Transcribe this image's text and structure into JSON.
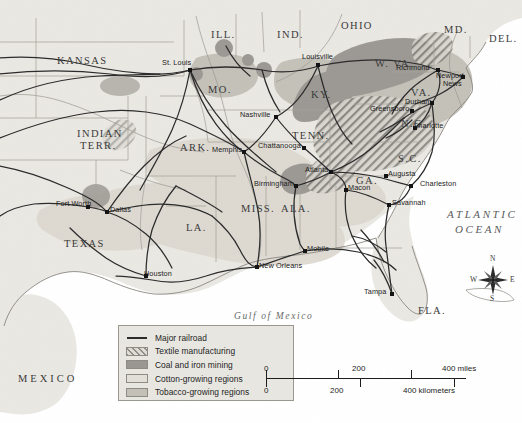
{
  "map": {
    "title_region": "The New South",
    "states": [
      {
        "label": "KANSAS",
        "x": 57,
        "y": 55,
        "size": "big"
      },
      {
        "label": "ILL.",
        "x": 211,
        "y": 29,
        "size": "big"
      },
      {
        "label": "IND.",
        "x": 277,
        "y": 29,
        "size": "big"
      },
      {
        "label": "OHIO",
        "x": 341,
        "y": 20,
        "size": "big"
      },
      {
        "label": "MD.",
        "x": 444,
        "y": 24,
        "size": "big"
      },
      {
        "label": "DEL.",
        "x": 489,
        "y": 33,
        "size": "big"
      },
      {
        "label": "MO.",
        "x": 208,
        "y": 84,
        "size": "big"
      },
      {
        "label": "KY.",
        "x": 311,
        "y": 89,
        "size": "big"
      },
      {
        "label": "W. VA.",
        "x": 375,
        "y": 58,
        "size": "big"
      },
      {
        "label": "VA.",
        "x": 411,
        "y": 87,
        "size": "big"
      },
      {
        "label": "N.C.",
        "x": 401,
        "y": 118,
        "size": "big"
      },
      {
        "label": "S.C.",
        "x": 398,
        "y": 153,
        "size": "big"
      },
      {
        "label": "GA.",
        "x": 356,
        "y": 175,
        "size": "big"
      },
      {
        "label": "TENN.",
        "x": 292,
        "y": 130,
        "size": "big"
      },
      {
        "label": "ARK.",
        "x": 180,
        "y": 142,
        "size": "big"
      },
      {
        "label": "MISS.",
        "x": 241,
        "y": 203,
        "size": "big"
      },
      {
        "label": "ALA.",
        "x": 281,
        "y": 203,
        "size": "big"
      },
      {
        "label": "LA.",
        "x": 186,
        "y": 222,
        "size": "big"
      },
      {
        "label": "TEXAS",
        "x": 64,
        "y": 238,
        "size": "big"
      },
      {
        "label": "FLA.",
        "x": 418,
        "y": 305,
        "size": "big"
      },
      {
        "label": "INDIAN",
        "x": 77,
        "y": 128,
        "size": "big"
      },
      {
        "label": "TERR.",
        "x": 80,
        "y": 140,
        "size": "big"
      }
    ],
    "cities": [
      {
        "label": "St. Louis",
        "x": 190,
        "y": 70,
        "dx": -28,
        "dy": -8
      },
      {
        "label": "Louisville",
        "x": 318,
        "y": 65,
        "dx": -16,
        "dy": -9
      },
      {
        "label": "Richmond",
        "x": 438,
        "y": 70,
        "dx": -42,
        "dy": -3
      },
      {
        "label": "Newport",
        "x": 463,
        "y": 77,
        "dx": -27,
        "dy": -2
      },
      {
        "label": "News",
        "x": 463,
        "y": 77,
        "dx": -20,
        "dy": 6
      },
      {
        "label": "Greensboro",
        "x": 412,
        "y": 111,
        "dx": -42,
        "dy": -3
      },
      {
        "label": "Durham",
        "x": 432,
        "y": 103,
        "dx": -27,
        "dy": -2
      },
      {
        "label": "Charlotte",
        "x": 415,
        "y": 128,
        "dx": -2,
        "dy": -3
      },
      {
        "label": "Nashville",
        "x": 276,
        "y": 117,
        "dx": -36,
        "dy": -3
      },
      {
        "label": "Chattanooga",
        "x": 304,
        "y": 148,
        "dx": -46,
        "dy": -3
      },
      {
        "label": "Memphis",
        "x": 244,
        "y": 152,
        "dx": -32,
        "dy": -3
      },
      {
        "label": "Atlanta",
        "x": 331,
        "y": 172,
        "dx": -26,
        "dy": -3
      },
      {
        "label": "Macon",
        "x": 346,
        "y": 190,
        "dx": 2,
        "dy": -3
      },
      {
        "label": "Augusta",
        "x": 386,
        "y": 176,
        "dx": 2,
        "dy": -3
      },
      {
        "label": "Charleston",
        "x": 411,
        "y": 186,
        "dx": 9,
        "dy": -3
      },
      {
        "label": "Savannah",
        "x": 389,
        "y": 205,
        "dx": 3,
        "dy": -3
      },
      {
        "label": "Birmingham",
        "x": 296,
        "y": 186,
        "dx": -42,
        "dy": -3
      },
      {
        "label": "Mobile",
        "x": 305,
        "y": 251,
        "dx": 2,
        "dy": -3
      },
      {
        "label": "New Orleans",
        "x": 257,
        "y": 267,
        "dx": 2,
        "dy": -2
      },
      {
        "label": "Houston",
        "x": 146,
        "y": 276,
        "dx": -2,
        "dy": -3
      },
      {
        "label": "Dallas",
        "x": 107,
        "y": 212,
        "dx": 3,
        "dy": -3
      },
      {
        "label": "Fort Worth",
        "x": 88,
        "y": 207,
        "dx": -32,
        "dy": -4
      },
      {
        "label": "Tampa",
        "x": 392,
        "y": 294,
        "dx": -28,
        "dy": -3
      }
    ],
    "water_labels": [
      {
        "label": "ATLANTIC",
        "x": 447,
        "y": 208
      },
      {
        "label": "OCEAN",
        "x": 455,
        "y": 223
      }
    ],
    "gulf_label": "Gulf of Mexico",
    "mexico_label": "MEXICO"
  },
  "legend": {
    "items": [
      {
        "key": "railroad",
        "label": "Major railroad",
        "swatch": "line"
      },
      {
        "key": "textile",
        "label": "Textile manufacturing",
        "swatch": "textile"
      },
      {
        "key": "coal",
        "label": "Coal and iron mining",
        "swatch": "coal"
      },
      {
        "key": "cotton",
        "label": "Cotton-growing regions",
        "swatch": "cotton"
      },
      {
        "key": "tobacco",
        "label": "Tobacco-growing regions",
        "swatch": "tobacco"
      }
    ]
  },
  "scale": {
    "miles": {
      "ticks": [
        "0",
        "200",
        "400 miles"
      ],
      "positions": [
        0,
        94,
        188
      ]
    },
    "kilometers": {
      "ticks": [
        "0",
        "200",
        "400 kilometers"
      ],
      "positions": [
        0,
        72,
        145
      ]
    }
  },
  "compass": {
    "n": "N",
    "e": "E",
    "s": "S",
    "w": "W"
  },
  "colors": {
    "sea": "#ffffff",
    "land": "#eae8e3",
    "cotton": "#e2dfd8",
    "tobacco": "#c3c0b8",
    "coal": "#9a9792",
    "railroad": "#2b2b2b",
    "border": "#8a8780"
  }
}
